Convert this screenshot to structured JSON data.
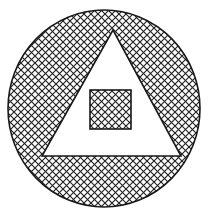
{
  "figure": {
    "background_color": "#ffffff",
    "stroke_color": "#1a1a1a",
    "hatch_color": "#222222",
    "canvas": {
      "width": 214,
      "height": 219
    },
    "shapes": {
      "circle": {
        "label": "outer-circle",
        "center_x": 104,
        "center_y": 108.5,
        "radius_x": 96,
        "radius_y": 98.5,
        "fill": "cross-hatch",
        "stroke_width": 1.6
      },
      "triangle": {
        "label": "inner-triangle",
        "apex_x": 113,
        "apex_y": 30,
        "base_left_x": 42,
        "base_left_y": 156,
        "base_right_x": 181,
        "base_right_y": 156,
        "fill": "white",
        "stroke_width": 1.6
      },
      "square": {
        "label": "innermost-square",
        "x": 90,
        "y": 90,
        "width": 41,
        "height": 39,
        "fill": "cross-hatch",
        "stroke_width": 1.6
      }
    },
    "hatch": {
      "pattern": "cross-hatch",
      "cell_size": 7,
      "angle_degrees": 45,
      "line_width": 1.15
    }
  }
}
